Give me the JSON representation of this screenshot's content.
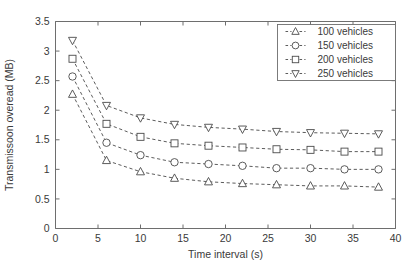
{
  "chart_data": {
    "type": "line",
    "title": "",
    "xlabel": "Time interval (s)",
    "ylabel": "Transmissoon overead (MB)",
    "xlim": [
      0,
      40
    ],
    "ylim": [
      0,
      3.5
    ],
    "xticks": [
      0,
      5,
      10,
      15,
      20,
      25,
      30,
      35,
      40
    ],
    "xtick_labels": [
      "0",
      "5",
      "10",
      "15",
      "20",
      "25",
      "30",
      "35",
      "40"
    ],
    "yticks": [
      0,
      0.5,
      1,
      1.5,
      2,
      2.5,
      3,
      3.5
    ],
    "ytick_labels": [
      "0",
      "0.5",
      "1",
      "1.5",
      "2",
      "2.5",
      "3",
      "3.5"
    ],
    "grid": false,
    "legend_position": "upper right",
    "linestyle": "dashed",
    "marker_fill": "none",
    "line_color": "#4a4a4a",
    "x": [
      2,
      6,
      10,
      14,
      18,
      22,
      26,
      30,
      34,
      38
    ],
    "series": [
      {
        "name": "100 vehicles",
        "marker": "triangle-up",
        "values": [
          2.27,
          1.15,
          0.96,
          0.85,
          0.79,
          0.76,
          0.74,
          0.72,
          0.72,
          0.7
        ]
      },
      {
        "name": "150 vehicles",
        "marker": "circle",
        "values": [
          2.57,
          1.45,
          1.24,
          1.12,
          1.09,
          1.06,
          1.02,
          1.02,
          1.0,
          1.0
        ]
      },
      {
        "name": "200 vehicles",
        "marker": "square",
        "values": [
          2.87,
          1.77,
          1.55,
          1.44,
          1.4,
          1.37,
          1.34,
          1.33,
          1.3,
          1.3
        ]
      },
      {
        "name": "250 vehicles",
        "marker": "triangle-down",
        "values": [
          3.18,
          2.08,
          1.87,
          1.76,
          1.71,
          1.68,
          1.64,
          1.62,
          1.61,
          1.6
        ]
      }
    ]
  },
  "legend": {
    "entries": [
      {
        "label": "100 vehicles"
      },
      {
        "label": "150 vehicles"
      },
      {
        "label": "200 vehicles"
      },
      {
        "label": "250 vehicles"
      }
    ]
  }
}
